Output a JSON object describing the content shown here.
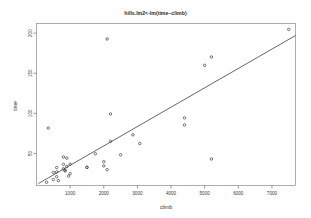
{
  "chart_data": {
    "type": "scatter",
    "title": "hills.lm2<-lm(time~climb)",
    "xlabel": "climb",
    "ylabel": "time",
    "xlim": [
      0,
      7700
    ],
    "ylim": [
      10,
      212
    ],
    "grid": false,
    "legend": null,
    "xticks": [
      1000,
      2000,
      3000,
      4000,
      5000,
      6000,
      7000
    ],
    "yticks": [
      50,
      100,
      150,
      200
    ],
    "xtick_labels": [
      "1000",
      "2000",
      "3000",
      "4000",
      "5000",
      "6000",
      "7000"
    ],
    "ytick_labels": [
      "50",
      "100",
      "150",
      "200"
    ],
    "series": [
      {
        "name": "hill races",
        "type": "scatter",
        "marker": "open-circle",
        "points": [
          {
            "x": 650,
            "y": 16.083
          },
          {
            "x": 2500,
            "y": 48.35
          },
          {
            "x": 900,
            "y": 33.65
          },
          {
            "x": 800,
            "y": 45.6
          },
          {
            "x": 3070,
            "y": 62.267
          },
          {
            "x": 2866,
            "y": 73.217
          },
          {
            "x": 7500,
            "y": 204.617
          },
          {
            "x": 800,
            "y": 36.367
          },
          {
            "x": 2100,
            "y": 29.75
          },
          {
            "x": 2000,
            "y": 39.75
          },
          {
            "x": 500,
            "y": 17.417
          },
          {
            "x": 4400,
            "y": 94.383
          },
          {
            "x": 600,
            "y": 20.95
          },
          {
            "x": 950,
            "y": 21.6
          },
          {
            "x": 1750,
            "y": 49.633
          },
          {
            "x": 500,
            "y": 26.217
          },
          {
            "x": 4400,
            "y": 85.583
          },
          {
            "x": 600,
            "y": 32.383
          },
          {
            "x": 5200,
            "y": 170.25
          },
          {
            "x": 850,
            "y": 28.1
          },
          {
            "x": 5000,
            "y": 159.833
          },
          {
            "x": 1500,
            "y": 32.633
          },
          {
            "x": 1000,
            "y": 24.683
          },
          {
            "x": 2200,
            "y": 99.15
          },
          {
            "x": 350,
            "y": 81.583
          },
          {
            "x": 1000,
            "y": 36.55
          },
          {
            "x": 1500,
            "y": 32.55
          },
          {
            "x": 5200,
            "y": 43.05
          },
          {
            "x": 850,
            "y": 29.233
          },
          {
            "x": 300,
            "y": 14.033
          },
          {
            "x": 800,
            "y": 30.8
          },
          {
            "x": 2100,
            "y": 192.667
          },
          {
            "x": 2200,
            "y": 65.0
          },
          {
            "x": 900,
            "y": 44.133
          },
          {
            "x": 600,
            "y": 26.933
          },
          {
            "x": 2000,
            "y": 34.433
          }
        ]
      }
    ],
    "fit_line": {
      "name": "lm(time~climb)",
      "type": "line",
      "x0": 60,
      "y0": 12.5,
      "x1": 7700,
      "y1": 197.0
    }
  }
}
